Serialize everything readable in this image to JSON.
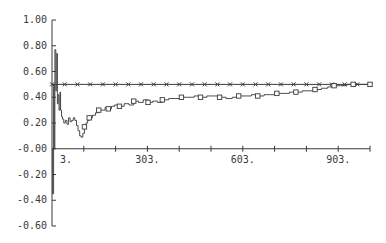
{
  "chart_data": {
    "type": "line",
    "title": "",
    "xlabel": "",
    "ylabel": "",
    "xlim": [
      3,
      1003
    ],
    "ylim": [
      -0.6,
      1.0
    ],
    "grid": false,
    "legend": null,
    "x_ticks": [
      {
        "value": 3,
        "label": "3."
      },
      {
        "value": 103,
        "label": ""
      },
      {
        "value": 203,
        "label": ""
      },
      {
        "value": 303,
        "label": "303."
      },
      {
        "value": 403,
        "label": ""
      },
      {
        "value": 503,
        "label": ""
      },
      {
        "value": 603,
        "label": "603."
      },
      {
        "value": 703,
        "label": ""
      },
      {
        "value": 803,
        "label": ""
      },
      {
        "value": 903,
        "label": "903."
      },
      {
        "value": 1003,
        "label": ""
      }
    ],
    "y_ticks": [
      {
        "value": 1.0,
        "label": "1.00"
      },
      {
        "value": 0.8,
        "label": "0.80"
      },
      {
        "value": 0.6,
        "label": "0.60"
      },
      {
        "value": 0.4,
        "label": "0.40"
      },
      {
        "value": 0.2,
        "label": "0.20"
      },
      {
        "value": 0.0,
        "label": "-0.00"
      },
      {
        "value": -0.2,
        "label": "-0.20"
      },
      {
        "value": -0.4,
        "label": "-0.40"
      },
      {
        "value": -0.6,
        "label": "-0.60"
      }
    ],
    "series": [
      {
        "name": "reference (x markers)",
        "marker": "x",
        "x": [
          3,
          1003
        ],
        "values": [
          0.5,
          0.5
        ],
        "marker_every": 25
      },
      {
        "name": "estimate (square markers)",
        "marker": "square",
        "x": [
          3,
          5,
          8,
          10,
          12,
          15,
          18,
          20,
          22,
          25,
          28,
          30,
          33,
          36,
          40,
          45,
          50,
          55,
          60,
          65,
          70,
          75,
          80,
          85,
          90,
          95,
          100,
          105,
          110,
          115,
          120,
          130,
          140,
          150,
          160,
          170,
          180,
          190,
          200,
          215,
          230,
          245,
          260,
          275,
          290,
          305,
          320,
          335,
          350,
          370,
          390,
          410,
          430,
          450,
          470,
          490,
          510,
          530,
          550,
          570,
          590,
          610,
          630,
          650,
          670,
          690,
          710,
          730,
          750,
          770,
          790,
          810,
          830,
          850,
          870,
          890,
          910,
          930,
          950,
          970,
          990,
          1003
        ],
        "values": [
          0.0,
          -0.35,
          0.5,
          0.0,
          0.77,
          0.45,
          0.74,
          0.35,
          0.42,
          0.3,
          0.44,
          0.3,
          0.25,
          0.23,
          0.2,
          0.22,
          0.19,
          0.24,
          0.21,
          0.22,
          0.24,
          0.22,
          0.18,
          0.14,
          0.1,
          0.09,
          0.12,
          0.17,
          0.2,
          0.22,
          0.24,
          0.26,
          0.28,
          0.3,
          0.3,
          0.32,
          0.31,
          0.33,
          0.34,
          0.33,
          0.35,
          0.34,
          0.37,
          0.36,
          0.38,
          0.36,
          0.37,
          0.36,
          0.38,
          0.39,
          0.39,
          0.4,
          0.4,
          0.41,
          0.4,
          0.41,
          0.41,
          0.4,
          0.39,
          0.4,
          0.41,
          0.41,
          0.42,
          0.41,
          0.42,
          0.42,
          0.43,
          0.43,
          0.44,
          0.44,
          0.45,
          0.45,
          0.46,
          0.47,
          0.48,
          0.49,
          0.49,
          0.5,
          0.5,
          0.5,
          0.5,
          0.5
        ],
        "marker_every": 3
      }
    ]
  },
  "layout": {
    "plot_left_px": 52,
    "x_start_px": 52,
    "x_end_px": 370,
    "y_top_px": 20,
    "y_bottom_px": 226,
    "ink_color": "#3a3a3a"
  }
}
